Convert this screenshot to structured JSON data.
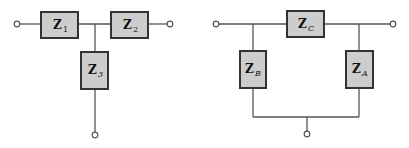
{
  "diagrams": {
    "tee_network": {
      "name": "T network",
      "impedances": [
        {
          "id": "z1",
          "symbol": "Z",
          "subscript": "1"
        },
        {
          "id": "z2",
          "symbol": "Z",
          "subscript": "2"
        },
        {
          "id": "z3",
          "symbol": "Z",
          "subscript": "3"
        }
      ]
    },
    "pi_network": {
      "name": "Pi network",
      "impedances": [
        {
          "id": "zc",
          "symbol": "Z",
          "subscript": "C"
        },
        {
          "id": "zb",
          "symbol": "Z",
          "subscript": "B"
        },
        {
          "id": "za",
          "symbol": "Z",
          "subscript": "A"
        }
      ]
    }
  },
  "colors": {
    "box_fill": "#cdcdcd",
    "box_stroke": "#333333",
    "wire": "#555555",
    "background": "#ffffff"
  }
}
